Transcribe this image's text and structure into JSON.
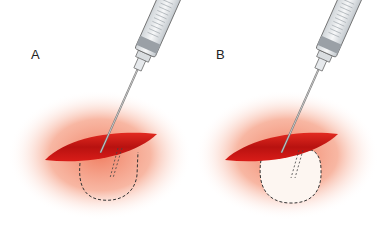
{
  "panels": [
    {
      "label": "A",
      "pocket_state": "empty",
      "pocket_fill": "none",
      "description": "Needle inserted through wound edge; dashed outline marks the undermined pocket"
    },
    {
      "label": "B",
      "pocket_state": "filled",
      "pocket_fill": "#fdf6f1",
      "description": "Fluid injected; pocket balloons and blanches (white)"
    }
  ],
  "colors": {
    "wound": "#d21a16",
    "wound_dark": "#b31010",
    "skin_glow": "#f08a6c",
    "outline": "#333333",
    "syringe_body": "#e9ecef",
    "syringe_plunger": "#9aa0a6"
  },
  "icons": [
    "syringe-icon",
    "needle-icon",
    "wound-icon"
  ]
}
